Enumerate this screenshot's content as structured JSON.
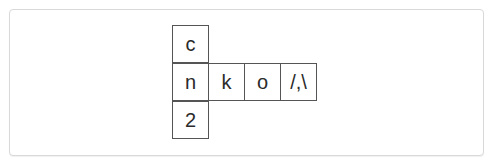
{
  "grid": {
    "cells": [
      {
        "id": "r0c0",
        "text": "c"
      },
      {
        "id": "r1c0",
        "text": "n"
      },
      {
        "id": "r1c1",
        "text": "k"
      },
      {
        "id": "r1c2",
        "text": "o"
      },
      {
        "id": "r1c3",
        "text": "/,\\"
      },
      {
        "id": "r2c0",
        "text": "2"
      }
    ]
  },
  "colors": {
    "border": "#555555",
    "text": "#2b2b2b",
    "panel_border": "#d9d9d9"
  }
}
